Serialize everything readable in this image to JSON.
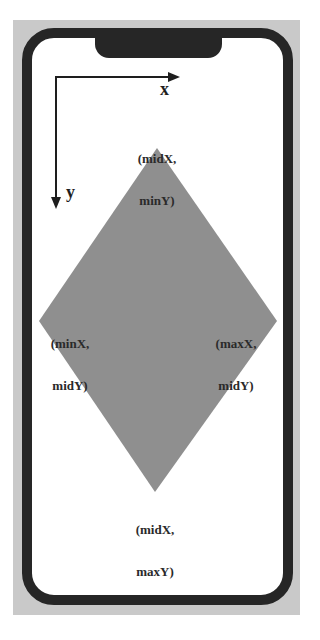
{
  "diagram": {
    "type": "coordinate-diagram",
    "axes": {
      "x_label": "x",
      "y_label": "y"
    },
    "shape": {
      "kind": "diamond",
      "fill": "#8f8f8f"
    },
    "vertices": {
      "top": {
        "line1": "(midX,",
        "line2": "minY)"
      },
      "left": {
        "line1": "(minX,",
        "line2": "midY)"
      },
      "right": {
        "line1": "(maxX,",
        "line2": "midY)"
      },
      "bottom": {
        "line1": "(midX,",
        "line2": "maxY)"
      }
    },
    "colors": {
      "phone_border": "#262626",
      "frame_background": "#c9c9c9",
      "screen": "#ffffff",
      "diamond": "#8f8f8f",
      "text": "#2a2a2a"
    }
  }
}
